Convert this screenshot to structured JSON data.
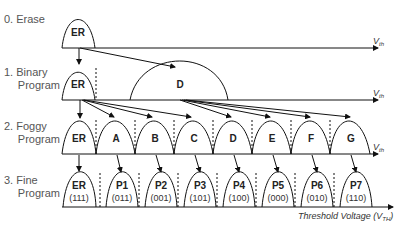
{
  "stages": [
    {
      "label_line1": "0. Erase",
      "label_line2": ""
    },
    {
      "label_line1": "1. Binary",
      "label_line2": "Program"
    },
    {
      "label_line1": "2. Foggy",
      "label_line2": "Program"
    },
    {
      "label_line1": "3. Fine",
      "label_line2": "Program"
    }
  ],
  "axis_label": "V",
  "axis_sub": "th",
  "x_axis_title": "Threshold Voltage (V",
  "x_axis_title_sub": "TH",
  "x_axis_title_end": ")",
  "erase_states": [
    "ER"
  ],
  "binary_states": [
    "ER",
    "D"
  ],
  "foggy_states": [
    "ER",
    "A",
    "B",
    "C",
    "D",
    "E",
    "F",
    "G"
  ],
  "fine_states": [
    {
      "name": "ER",
      "code": "(111)"
    },
    {
      "name": "P1",
      "code": "(011)"
    },
    {
      "name": "P2",
      "code": "(001)"
    },
    {
      "name": "P3",
      "code": "(101)"
    },
    {
      "name": "P4",
      "code": "(100)"
    },
    {
      "name": "P5",
      "code": "(000)"
    },
    {
      "name": "P6",
      "code": "(010)"
    },
    {
      "name": "P7",
      "code": "(110)"
    }
  ]
}
